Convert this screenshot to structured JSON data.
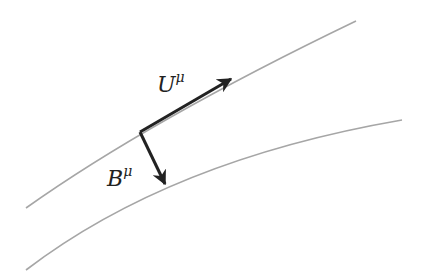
{
  "diagram": {
    "curves": [
      {
        "name": "upper-worldline",
        "color": "#a6a6a6"
      },
      {
        "name": "lower-worldline",
        "color": "#a6a6a6"
      }
    ],
    "vectors": [
      {
        "name": "U-vector",
        "label_base": "U",
        "label_sup": "μ",
        "color": "#222222"
      },
      {
        "name": "B-vector",
        "label_base": "B",
        "label_sup": "μ",
        "color": "#222222"
      }
    ]
  }
}
